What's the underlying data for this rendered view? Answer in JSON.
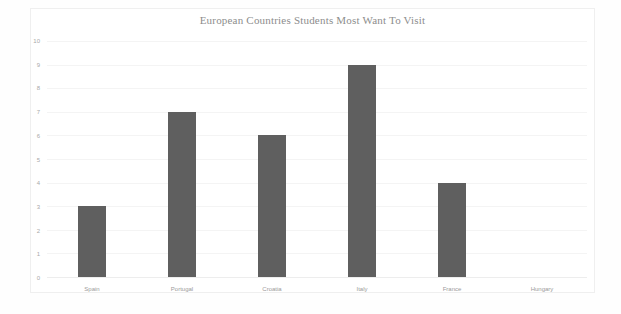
{
  "chart_data": {
    "type": "bar",
    "title": "European Countries Students Most Want To Visit",
    "xlabel": "",
    "ylabel": "",
    "categories": [
      "Spain",
      "Portugal",
      "Croatia",
      "Italy",
      "France",
      "Hungary"
    ],
    "values": [
      3,
      7,
      6,
      9,
      4,
      0
    ],
    "ylim": [
      0,
      10
    ],
    "ytick_labels": [
      "10",
      "9",
      "8",
      "7",
      "6",
      "5",
      "4",
      "3",
      "2",
      "1",
      "0"
    ],
    "ytick_values": [
      10,
      9,
      8,
      7,
      6,
      5,
      4,
      3,
      2,
      1,
      0
    ],
    "grid": true,
    "legend": false,
    "bar_color": "#5f5f5f",
    "title_color": "#8d8d8d",
    "tick_color": "#a9a9a9",
    "gridline_color": "#f4f4f4",
    "background_color": "#ffffff"
  }
}
